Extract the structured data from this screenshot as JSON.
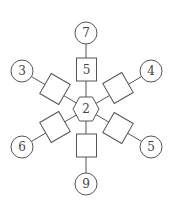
{
  "diagram": {
    "center": {
      "shape": "hexagon",
      "label": "2"
    },
    "spokes": [
      {
        "direction": "up",
        "square_label": "5",
        "circle_label": "7"
      },
      {
        "direction": "upper-right",
        "square_label": "",
        "circle_label": "4"
      },
      {
        "direction": "lower-right",
        "square_label": "",
        "circle_label": "5"
      },
      {
        "direction": "down",
        "square_label": "",
        "circle_label": "9"
      },
      {
        "direction": "lower-left",
        "square_label": "",
        "circle_label": "6"
      },
      {
        "direction": "upper-left",
        "square_label": "",
        "circle_label": "3"
      }
    ]
  },
  "colors": {
    "stroke": "#555555",
    "text": "#444444",
    "background": "#ffffff"
  }
}
